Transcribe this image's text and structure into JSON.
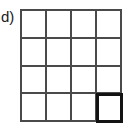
{
  "figure": {
    "label": "d)",
    "background_color": "#ffffff",
    "line_color": "#4a4a4a",
    "highlight_color": "#131313"
  },
  "grid": {
    "rows": 4,
    "columns": 4,
    "cells": [
      {
        "row": 1,
        "col": 1,
        "highlighted": false,
        "content": ""
      },
      {
        "row": 1,
        "col": 2,
        "highlighted": false,
        "content": ""
      },
      {
        "row": 1,
        "col": 3,
        "highlighted": false,
        "content": ""
      },
      {
        "row": 1,
        "col": 4,
        "highlighted": false,
        "content": ""
      },
      {
        "row": 2,
        "col": 1,
        "highlighted": false,
        "content": ""
      },
      {
        "row": 2,
        "col": 2,
        "highlighted": false,
        "content": ""
      },
      {
        "row": 2,
        "col": 3,
        "highlighted": false,
        "content": ""
      },
      {
        "row": 2,
        "col": 4,
        "highlighted": false,
        "content": ""
      },
      {
        "row": 3,
        "col": 1,
        "highlighted": false,
        "content": ""
      },
      {
        "row": 3,
        "col": 2,
        "highlighted": false,
        "content": ""
      },
      {
        "row": 3,
        "col": 3,
        "highlighted": false,
        "content": ""
      },
      {
        "row": 3,
        "col": 4,
        "highlighted": false,
        "content": ""
      },
      {
        "row": 4,
        "col": 1,
        "highlighted": false,
        "content": ""
      },
      {
        "row": 4,
        "col": 2,
        "highlighted": false,
        "content": ""
      },
      {
        "row": 4,
        "col": 3,
        "highlighted": false,
        "content": ""
      },
      {
        "row": 4,
        "col": 4,
        "highlighted": true,
        "content": ""
      }
    ]
  }
}
